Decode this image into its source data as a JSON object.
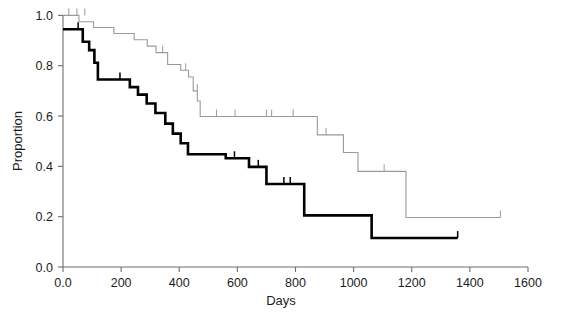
{
  "chart_data": {
    "type": "line",
    "title": "",
    "subtitle": "",
    "xlabel": "Days",
    "ylabel": "Proportion",
    "xlim": [
      0,
      1600
    ],
    "ylim": [
      0.0,
      1.0
    ],
    "xticks": [
      0,
      200,
      400,
      600,
      800,
      1000,
      1200,
      1400,
      1600
    ],
    "xticklabels": [
      "0.0",
      "200",
      "400",
      "600",
      "800",
      "1000",
      "1200",
      "1400",
      "1600"
    ],
    "yticks": [
      0.0,
      0.2,
      0.4,
      0.6,
      0.8,
      1.0
    ],
    "yticklabels": [
      "0.0",
      "0.2",
      "0.4",
      "0.6",
      "0.8",
      "1.0"
    ],
    "grid": false,
    "legend": "none",
    "plot_style": "kaplan-meier step survival curves",
    "series": [
      {
        "name": "group-thin-grey",
        "style": "step",
        "color": "#9a9a9a",
        "linewidth": 1.1,
        "steps": [
          {
            "x": 0,
            "y": 1.0
          },
          {
            "x": 55,
            "y": 1.0
          },
          {
            "x": 55,
            "y": 0.975
          },
          {
            "x": 105,
            "y": 0.975
          },
          {
            "x": 105,
            "y": 0.952
          },
          {
            "x": 175,
            "y": 0.952
          },
          {
            "x": 175,
            "y": 0.928
          },
          {
            "x": 245,
            "y": 0.928
          },
          {
            "x": 245,
            "y": 0.903
          },
          {
            "x": 290,
            "y": 0.903
          },
          {
            "x": 290,
            "y": 0.878
          },
          {
            "x": 320,
            "y": 0.878
          },
          {
            "x": 320,
            "y": 0.852
          },
          {
            "x": 360,
            "y": 0.852
          },
          {
            "x": 360,
            "y": 0.805
          },
          {
            "x": 405,
            "y": 0.805
          },
          {
            "x": 405,
            "y": 0.782
          },
          {
            "x": 432,
            "y": 0.782
          },
          {
            "x": 432,
            "y": 0.755
          },
          {
            "x": 448,
            "y": 0.755
          },
          {
            "x": 448,
            "y": 0.7
          },
          {
            "x": 462,
            "y": 0.7
          },
          {
            "x": 462,
            "y": 0.66
          },
          {
            "x": 472,
            "y": 0.66
          },
          {
            "x": 472,
            "y": 0.598
          },
          {
            "x": 875,
            "y": 0.598
          },
          {
            "x": 875,
            "y": 0.525
          },
          {
            "x": 965,
            "y": 0.525
          },
          {
            "x": 965,
            "y": 0.455
          },
          {
            "x": 1015,
            "y": 0.455
          },
          {
            "x": 1015,
            "y": 0.38
          },
          {
            "x": 1180,
            "y": 0.38
          },
          {
            "x": 1180,
            "y": 0.197
          },
          {
            "x": 1505,
            "y": 0.197
          }
        ],
        "censor_marks": [
          {
            "x": 20,
            "y": 1.0
          },
          {
            "x": 48,
            "y": 1.0
          },
          {
            "x": 75,
            "y": 1.0
          },
          {
            "x": 343,
            "y": 0.852
          },
          {
            "x": 422,
            "y": 0.782
          },
          {
            "x": 462,
            "y": 0.7
          },
          {
            "x": 528,
            "y": 0.598
          },
          {
            "x": 592,
            "y": 0.598
          },
          {
            "x": 700,
            "y": 0.598
          },
          {
            "x": 718,
            "y": 0.598
          },
          {
            "x": 792,
            "y": 0.598
          },
          {
            "x": 905,
            "y": 0.525
          },
          {
            "x": 1105,
            "y": 0.38
          },
          {
            "x": 1505,
            "y": 0.197
          }
        ]
      },
      {
        "name": "group-thick-black",
        "style": "step",
        "color": "#000000",
        "linewidth": 2.6,
        "steps": [
          {
            "x": 0,
            "y": 0.945
          },
          {
            "x": 68,
            "y": 0.945
          },
          {
            "x": 68,
            "y": 0.895
          },
          {
            "x": 90,
            "y": 0.895
          },
          {
            "x": 90,
            "y": 0.862
          },
          {
            "x": 108,
            "y": 0.862
          },
          {
            "x": 108,
            "y": 0.812
          },
          {
            "x": 120,
            "y": 0.812
          },
          {
            "x": 120,
            "y": 0.745
          },
          {
            "x": 230,
            "y": 0.745
          },
          {
            "x": 230,
            "y": 0.715
          },
          {
            "x": 258,
            "y": 0.715
          },
          {
            "x": 258,
            "y": 0.685
          },
          {
            "x": 288,
            "y": 0.685
          },
          {
            "x": 288,
            "y": 0.65
          },
          {
            "x": 318,
            "y": 0.65
          },
          {
            "x": 318,
            "y": 0.612
          },
          {
            "x": 352,
            "y": 0.612
          },
          {
            "x": 352,
            "y": 0.57
          },
          {
            "x": 378,
            "y": 0.57
          },
          {
            "x": 378,
            "y": 0.53
          },
          {
            "x": 405,
            "y": 0.53
          },
          {
            "x": 405,
            "y": 0.492
          },
          {
            "x": 430,
            "y": 0.492
          },
          {
            "x": 430,
            "y": 0.448
          },
          {
            "x": 560,
            "y": 0.448
          },
          {
            "x": 560,
            "y": 0.432
          },
          {
            "x": 640,
            "y": 0.432
          },
          {
            "x": 640,
            "y": 0.398
          },
          {
            "x": 700,
            "y": 0.398
          },
          {
            "x": 700,
            "y": 0.33
          },
          {
            "x": 830,
            "y": 0.33
          },
          {
            "x": 830,
            "y": 0.205
          },
          {
            "x": 1062,
            "y": 0.205
          },
          {
            "x": 1062,
            "y": 0.115
          },
          {
            "x": 1358,
            "y": 0.115
          }
        ],
        "censor_marks": [
          {
            "x": 52,
            "y": 0.945
          },
          {
            "x": 196,
            "y": 0.745
          },
          {
            "x": 590,
            "y": 0.432
          },
          {
            "x": 672,
            "y": 0.398
          },
          {
            "x": 760,
            "y": 0.33
          },
          {
            "x": 782,
            "y": 0.33
          },
          {
            "x": 1358,
            "y": 0.115
          }
        ]
      }
    ]
  },
  "axes": {
    "x_title": "Days",
    "y_title": "Proportion"
  }
}
